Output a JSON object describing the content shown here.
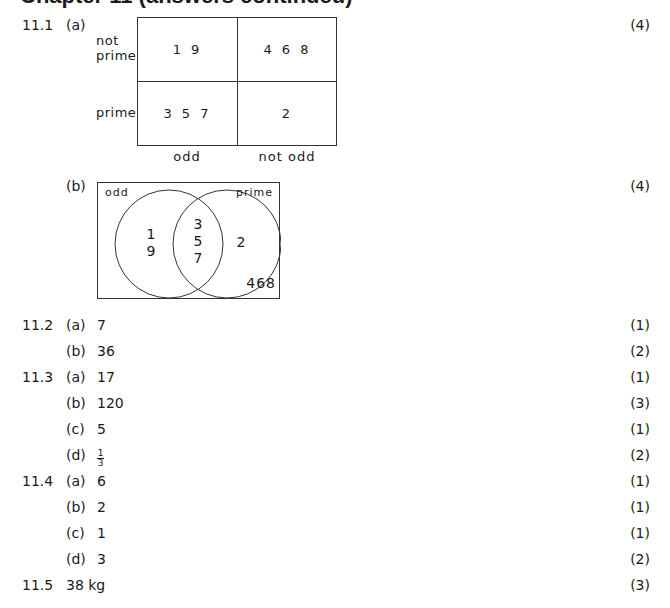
{
  "heading": "Chapter 11 (answers continued)",
  "q11_1": {
    "number": "11.1",
    "a": {
      "label": "(a)",
      "marks": "(4)",
      "row_labels": [
        "not\nprime",
        "prime"
      ],
      "col_labels": [
        "odd",
        "not odd"
      ],
      "cells": [
        [
          "1 9",
          "4 6 8"
        ],
        [
          "3 5 7",
          "2"
        ]
      ]
    },
    "b": {
      "label": "(b)",
      "marks": "(4)",
      "set_labels": [
        "odd",
        "prime"
      ],
      "odd_only": [
        "1",
        "9"
      ],
      "both": [
        "3",
        "5",
        "7"
      ],
      "prime_only": "2",
      "outside": "468"
    }
  },
  "answers": [
    {
      "q": "11.2",
      "part": "(a)",
      "answer": "7",
      "marks": "(1)"
    },
    {
      "q": "",
      "part": "(b)",
      "answer": "36",
      "marks": "(2)"
    },
    {
      "q": "11.3",
      "part": "(a)",
      "answer": "17",
      "marks": "(1)"
    },
    {
      "q": "",
      "part": "(b)",
      "answer": "120",
      "marks": "(3)"
    },
    {
      "q": "",
      "part": "(c)",
      "answer": "5",
      "marks": "(1)"
    },
    {
      "q": "",
      "part": "(d)",
      "answer_num": "1",
      "answer_den": "3",
      "marks": "(2)"
    },
    {
      "q": "11.4",
      "part": "(a)",
      "answer": "6",
      "marks": "(1)"
    },
    {
      "q": "",
      "part": "(b)",
      "answer": "2",
      "marks": "(1)"
    },
    {
      "q": "",
      "part": "(c)",
      "answer": "1",
      "marks": "(1)"
    },
    {
      "q": "",
      "part": "(d)",
      "answer": "3",
      "marks": "(2)"
    },
    {
      "q": "11.5",
      "part": "",
      "answer": "38 kg",
      "marks": "(3)"
    }
  ]
}
